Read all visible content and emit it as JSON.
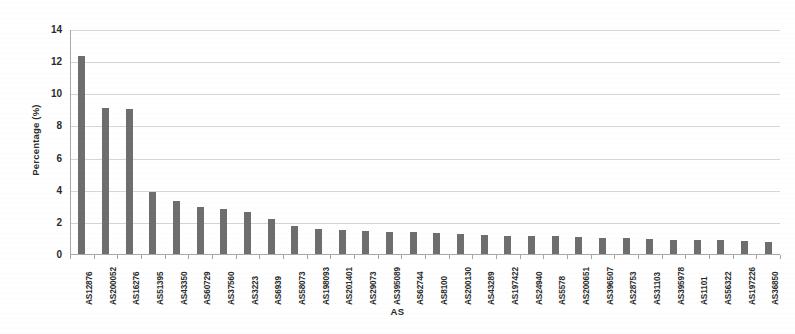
{
  "chart_data": {
    "type": "bar",
    "title": "",
    "xlabel": "AS",
    "ylabel": "Percentage (%)",
    "ylim": [
      0,
      14
    ],
    "yticks": [
      0,
      2,
      4,
      6,
      8,
      10,
      12,
      14
    ],
    "grid": true,
    "legend": null,
    "bar_color": "#6e6e6e",
    "gridline_color": "#d6d6d6",
    "axis_color": "#a8a8a8",
    "text_color": "#2b2b2b",
    "categories": [
      "AS12876",
      "AS200052",
      "AS16276",
      "AS51395",
      "AS43350",
      "AS60729",
      "AS37560",
      "AS3223",
      "AS6939",
      "AS58073",
      "AS198093",
      "AS201401",
      "AS29073",
      "AS395089",
      "AS62744",
      "AS8100",
      "AS200130",
      "AS43289",
      "AS197422",
      "AS24940",
      "AS5578",
      "AS200651",
      "AS396507",
      "AS28753",
      "AS31103",
      "AS395978",
      "AS1101",
      "AS56322",
      "AS197226",
      "AS36850"
    ],
    "values": [
      12.3,
      9.1,
      9.0,
      3.85,
      3.3,
      2.9,
      2.8,
      2.6,
      2.2,
      1.75,
      1.55,
      1.5,
      1.45,
      1.4,
      1.35,
      1.3,
      1.25,
      1.2,
      1.15,
      1.1,
      1.1,
      1.05,
      1.0,
      1.0,
      0.95,
      0.9,
      0.9,
      0.85,
      0.8,
      0.75
    ]
  },
  "axes": {
    "y_title": "Percentage (%)",
    "x_title": "AS"
  }
}
